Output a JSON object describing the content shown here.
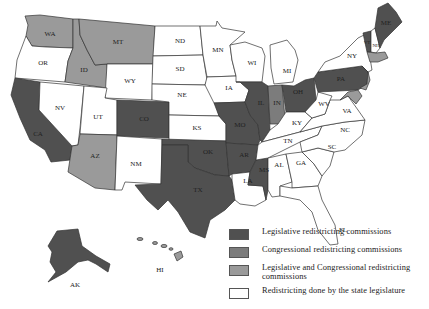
{
  "colors": {
    "legislative": "#505050",
    "congressional": "#7c7c7c",
    "both": "#9a9a9a",
    "legislature": "#ffffff"
  },
  "legend": {
    "items": [
      {
        "key": "legislative",
        "label": "Legislative redistricting commissions"
      },
      {
        "key": "congressional",
        "label": "Congressional redistricting commissions"
      },
      {
        "key": "both",
        "label": "Legislative and Congressional redistricting commissions"
      },
      {
        "key": "legislature",
        "label": "Redistricting done by the state legislature"
      }
    ]
  },
  "states": {
    "WA": {
      "label": "WA",
      "category": "both"
    },
    "OR": {
      "label": "OR",
      "category": "legislature"
    },
    "CA": {
      "label": "CA",
      "category": "legislative"
    },
    "ID": {
      "label": "ID",
      "category": "both"
    },
    "NV": {
      "label": "NV",
      "category": "legislature"
    },
    "MT": {
      "label": "MT",
      "category": "both"
    },
    "WY": {
      "label": "WY",
      "category": "legislature"
    },
    "UT": {
      "label": "UT",
      "category": "legislature"
    },
    "AZ": {
      "label": "AZ",
      "category": "both"
    },
    "CO": {
      "label": "CO",
      "category": "legislative"
    },
    "NM": {
      "label": "NM",
      "category": "legislature"
    },
    "ND": {
      "label": "ND",
      "category": "legislature"
    },
    "SD": {
      "label": "SD",
      "category": "legislature"
    },
    "NE": {
      "label": "NE",
      "category": "legislature"
    },
    "KS": {
      "label": "KS",
      "category": "legislature"
    },
    "OK": {
      "label": "OK",
      "category": "legislative"
    },
    "TX": {
      "label": "TX",
      "category": "legislative"
    },
    "MN": {
      "label": "MN",
      "category": "legislature"
    },
    "IA": {
      "label": "IA",
      "category": "legislature"
    },
    "MO": {
      "label": "MO",
      "category": "legislative"
    },
    "AR": {
      "label": "AR",
      "category": "legislative"
    },
    "LA": {
      "label": "LA",
      "category": "legislature"
    },
    "WI": {
      "label": "WI",
      "category": "legislature"
    },
    "IL": {
      "label": "IL",
      "category": "legislative"
    },
    "MS": {
      "label": "MS",
      "category": "legislative"
    },
    "MI": {
      "label": "MI",
      "category": "legislature"
    },
    "IN": {
      "label": "IN",
      "category": "congressional"
    },
    "KY": {
      "label": "KY",
      "category": "legislature"
    },
    "TN": {
      "label": "TN",
      "category": "legislature"
    },
    "AL": {
      "label": "AL",
      "category": "legislature"
    },
    "OH": {
      "label": "OH",
      "category": "legislative"
    },
    "WV": {
      "label": "WV",
      "category": "legislature"
    },
    "VA": {
      "label": "VA",
      "category": "legislature"
    },
    "NC": {
      "label": "NC",
      "category": "legislature"
    },
    "SC": {
      "label": "SC",
      "category": "legislature"
    },
    "GA": {
      "label": "GA",
      "category": "legislature"
    },
    "FL": {
      "label": "FL",
      "category": "legislature"
    },
    "PA": {
      "label": "PA",
      "category": "legislative"
    },
    "NY": {
      "label": "NY",
      "category": "legislature"
    },
    "VT": {
      "label": "VT",
      "category": "legislative"
    },
    "NH": {
      "label": "NH",
      "category": "legislature"
    },
    "ME": {
      "label": "ME",
      "category": "legislative"
    },
    "NJ": {
      "label": "",
      "category": "both"
    },
    "AK": {
      "label": "AK",
      "category": "legislative"
    },
    "HI": {
      "label": "HI",
      "category": "both"
    }
  }
}
